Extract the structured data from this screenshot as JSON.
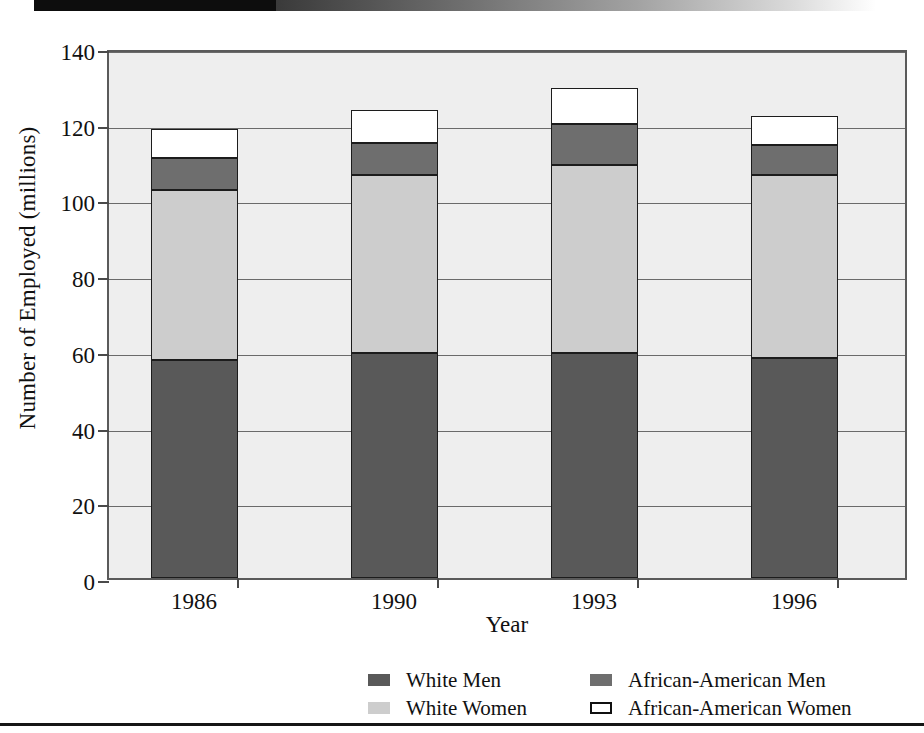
{
  "chart_data": {
    "type": "bar",
    "subtype": "stacked-vertical",
    "title": "",
    "xlabel": "Year",
    "ylabel": "Number of Employed (millions)",
    "categories": [
      "1986",
      "1990",
      "1993",
      "1996"
    ],
    "ylim": [
      0,
      140
    ],
    "yticks": [
      0,
      20,
      40,
      60,
      80,
      100,
      120,
      140
    ],
    "ytick_labels": [
      "0",
      "20",
      "40",
      "60",
      "80",
      "100",
      "120",
      "140"
    ],
    "grid": true,
    "legend_position": "bottom",
    "series": [
      {
        "name": "White Men",
        "color": "#595959",
        "values": [
          57.5,
          59.5,
          59.5,
          58.0
        ]
      },
      {
        "name": "White Women",
        "color": "#cdcdcd",
        "values": [
          45.0,
          47.0,
          49.5,
          48.5
        ]
      },
      {
        "name": "African-American Men",
        "color": "#6e6e6e",
        "values": [
          8.5,
          8.5,
          11.0,
          8.0
        ]
      },
      {
        "name": "African-American Women",
        "color": "#ffffff",
        "values": [
          7.5,
          8.5,
          9.5,
          7.5
        ]
      }
    ],
    "totals": [
      118.5,
      123.5,
      129.5,
      122.0
    ]
  },
  "axes": {
    "y_title": "Number of Employed (millions)",
    "x_title": "Year"
  },
  "legend": {
    "items": [
      {
        "label": "White Men",
        "swatch": "filled",
        "color": "#595959"
      },
      {
        "label": "African-American Men",
        "swatch": "filled",
        "color": "#6e6e6e"
      },
      {
        "label": "White Women",
        "swatch": "filled",
        "color": "#cdcdcd"
      },
      {
        "label": "African-American Women",
        "swatch": "outline",
        "color": "#ffffff"
      }
    ]
  },
  "decoration": {
    "top_band": "gradient-band",
    "bottom_rule": "horizontal-rule"
  }
}
